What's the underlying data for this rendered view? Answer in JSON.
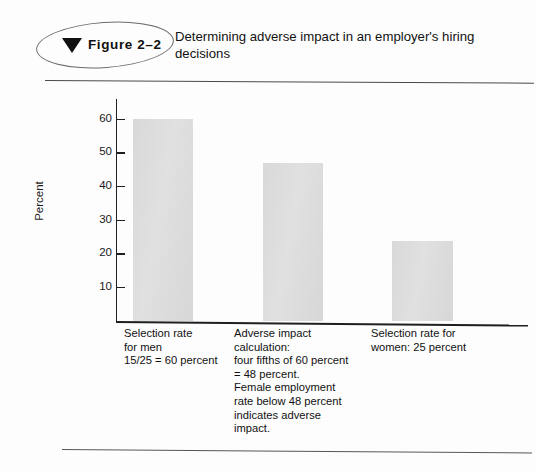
{
  "figure": {
    "badge_label": "Figure  2–2",
    "triangle_icon": "triangle-down-icon",
    "title": "Determining adverse impact in an employer's hiring decisions"
  },
  "chart_data": {
    "type": "bar",
    "title": "Determining adverse impact in an employer's hiring decisions",
    "xlabel": "",
    "ylabel": "Percent",
    "ylim": [
      0,
      65
    ],
    "yticks": [
      10,
      20,
      30,
      40,
      50,
      60
    ],
    "ytick_labels": [
      "10",
      "20",
      "30",
      "40",
      "50",
      "60"
    ],
    "grid": false,
    "legend": "none",
    "bar_color": "#dcdcdc",
    "categories": [
      "Selection rate for men",
      "Adverse impact calculation",
      "Selection rate for women"
    ],
    "values": [
      60,
      47,
      24
    ],
    "captions": [
      "Selection rate\nfor men\n15/25 = 60 percent",
      "Adverse impact\ncalculation:\nfour fifths of 60 percent\n= 48 percent.\nFemale employment\nrate below 48 percent\nindicates adverse\nimpact.",
      "Selection rate for\nwomen: 25 percent"
    ]
  },
  "colors": {
    "bar": "#dcdcdc",
    "axis": "#1f1f1f",
    "rule": "#4a4a4a",
    "text": "#111111"
  }
}
